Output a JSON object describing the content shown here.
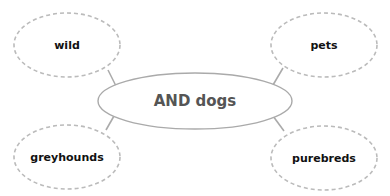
{
  "diagram": {
    "type": "concept-map",
    "center": {
      "label": "AND dogs",
      "color": "#555555"
    },
    "nodes": [
      {
        "id": "wild",
        "label": "wild"
      },
      {
        "id": "pets",
        "label": "pets"
      },
      {
        "id": "greyhounds",
        "label": "greyhounds"
      },
      {
        "id": "purebreds",
        "label": "purebreds"
      }
    ],
    "colors": {
      "dashed_border": "#bbbbbb",
      "center_border": "#aaaaaa",
      "connector": "#aaaaaa",
      "node_text": "#111111"
    }
  }
}
